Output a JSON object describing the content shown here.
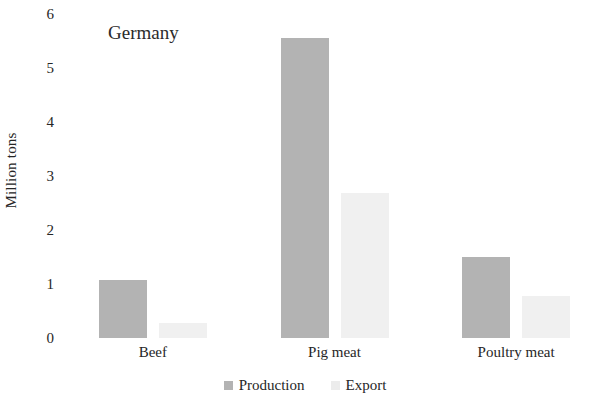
{
  "chart_data": {
    "type": "bar",
    "title": "Germany",
    "xlabel": "",
    "ylabel": "Million tons",
    "categories": [
      "Beef",
      "Pig meat",
      "Poultry meat"
    ],
    "series": [
      {
        "name": "Production",
        "color": "#b3b3b3",
        "values": [
          1.08,
          5.55,
          1.5
        ]
      },
      {
        "name": "Export",
        "color": "#f0f0f0",
        "values": [
          0.28,
          2.68,
          0.78
        ]
      }
    ],
    "ylim": [
      0,
      6
    ],
    "yticks": [
      0,
      1,
      2,
      3,
      4,
      5,
      6
    ],
    "ytick_labels": [
      "0",
      "1",
      "2",
      "3",
      "4",
      "5",
      "6"
    ],
    "grid": false,
    "legend_position": "bottom-center",
    "background": "#ffffff"
  },
  "legend": {
    "items": [
      {
        "label": "Production",
        "swatch": "production-swatch"
      },
      {
        "label": "Export",
        "swatch": "export-swatch"
      }
    ]
  }
}
